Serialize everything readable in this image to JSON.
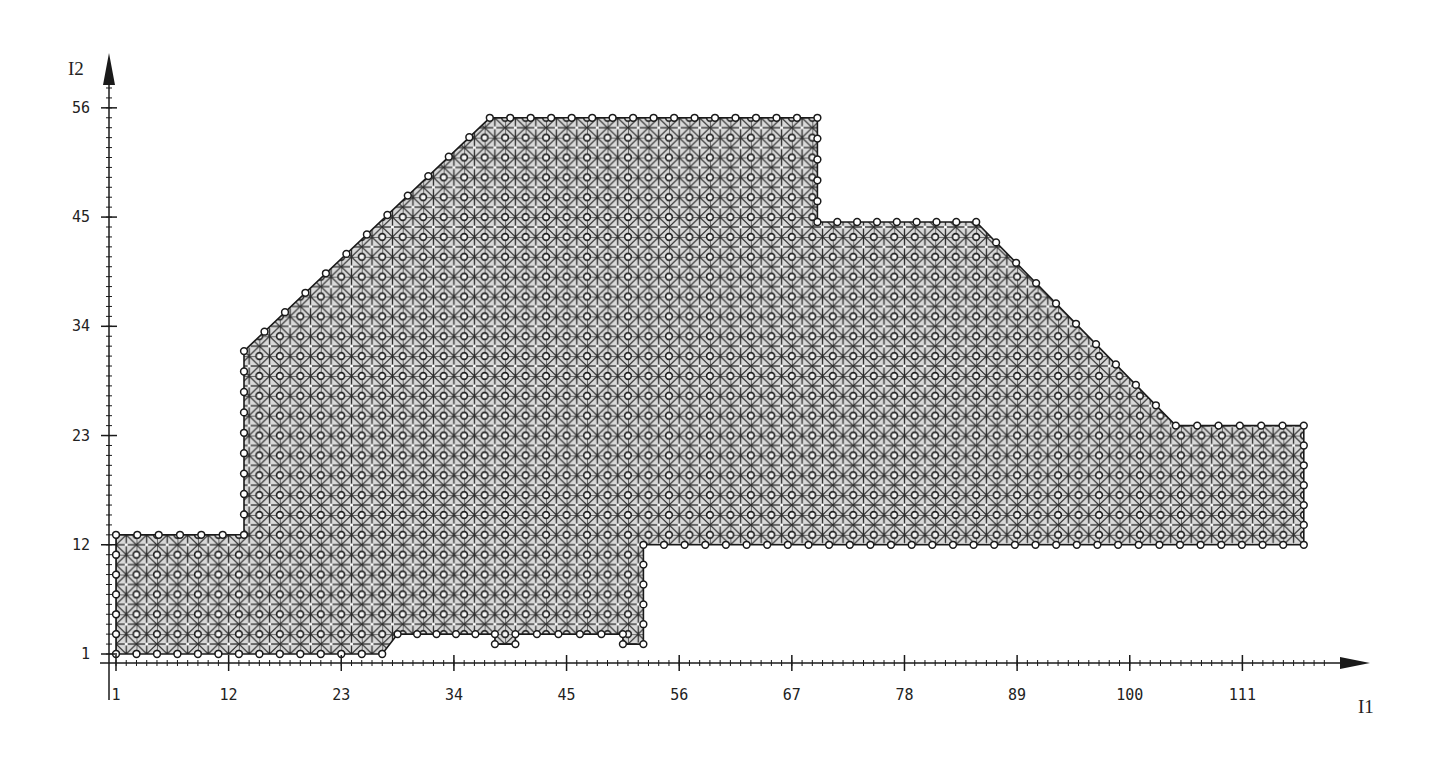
{
  "chart_data": {
    "type": "mesh-region",
    "title": "",
    "xlabel": "I1",
    "ylabel": "I2",
    "x_ticks": [
      1,
      12,
      23,
      34,
      45,
      56,
      67,
      78,
      89,
      100,
      111
    ],
    "y_ticks": [
      1,
      12,
      23,
      34,
      45,
      56
    ],
    "x_tick_labels": [
      "1",
      "12",
      "23",
      "34",
      "45",
      "56",
      "67",
      "78",
      "89",
      "100",
      "111"
    ],
    "y_tick_labels": [
      "1",
      "12",
      "23",
      "34",
      "45",
      "56"
    ],
    "minor_tick_step": 1,
    "xlim": [
      0,
      122
    ],
    "ylim": [
      0,
      60
    ],
    "grid": false,
    "node_spacing": 2,
    "region_polygon": [
      [
        1,
        1
      ],
      [
        27,
        1
      ],
      [
        28.5,
        3
      ],
      [
        38,
        3
      ],
      [
        38,
        2
      ],
      [
        40,
        2
      ],
      [
        40,
        3
      ],
      [
        50.5,
        3
      ],
      [
        50.5,
        2
      ],
      [
        52.5,
        2
      ],
      [
        52.5,
        12
      ],
      [
        117,
        12
      ],
      [
        117,
        24
      ],
      [
        104.5,
        24
      ],
      [
        85,
        44.5
      ],
      [
        69.5,
        44.5
      ],
      [
        69.5,
        55
      ],
      [
        37.5,
        55
      ],
      [
        13.5,
        31.5
      ],
      [
        13.5,
        13
      ],
      [
        1,
        13
      ]
    ],
    "sub_regions": [
      {
        "name": "left-block",
        "i1": [
          1,
          13.5
        ],
        "i2": [
          1,
          13
        ]
      },
      {
        "name": "middle-block",
        "i1": [
          13.5,
          69.5
        ],
        "i2": [
          1,
          55
        ]
      },
      {
        "name": "right-block",
        "i1": [
          52.5,
          117
        ],
        "i2": [
          12,
          44.5
        ]
      }
    ]
  },
  "axes": {
    "x_title": "I1",
    "y_title": "I2"
  }
}
